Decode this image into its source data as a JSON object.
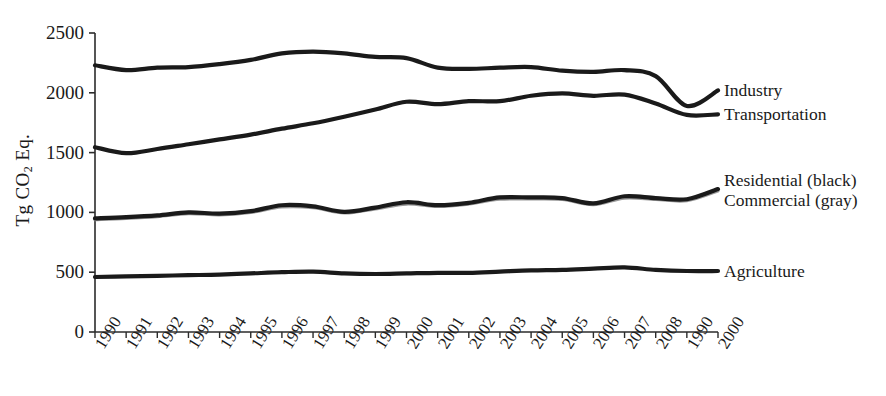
{
  "chart_data": {
    "type": "line",
    "title": "",
    "subtitle": "",
    "xlabel": "",
    "ylabel": "Tg CO2 Eq.",
    "ylabel_parts": {
      "prefix": "Tg CO",
      "sub": "2",
      "suffix": " Eq."
    },
    "grid": false,
    "legend_position": "inline-right",
    "ylim": [
      0,
      2500
    ],
    "yticks": [
      0,
      500,
      1000,
      1500,
      2000,
      2500
    ],
    "ytick_labels": [
      "0",
      "500",
      "1000",
      "1500",
      "2000",
      "2500"
    ],
    "categories": [
      "1990",
      "1991",
      "1992",
      "1993",
      "1994",
      "1995",
      "1996",
      "1997",
      "1998",
      "1999",
      "2000",
      "2001",
      "2002",
      "2003",
      "2004",
      "2005",
      "2006",
      "2007",
      "2008",
      "1990",
      "2000"
    ],
    "series": [
      {
        "name": "Industry",
        "color": "#1a1a1a",
        "label": "Industry",
        "values": [
          2230,
          2190,
          2210,
          2215,
          2240,
          2275,
          2330,
          2345,
          2330,
          2300,
          2290,
          2210,
          2200,
          2210,
          2215,
          2185,
          2175,
          2190,
          2140,
          1890,
          2020
        ]
      },
      {
        "name": "Transportation",
        "color": "#1a1a1a",
        "label": "Transportation",
        "values": [
          1545,
          1495,
          1530,
          1570,
          1610,
          1650,
          1700,
          1745,
          1800,
          1860,
          1925,
          1905,
          1930,
          1930,
          1975,
          1995,
          1975,
          1985,
          1910,
          1815,
          1820
        ]
      },
      {
        "name": "Residential (black)",
        "color": "#1a1a1a",
        "label": "Residential (black)",
        "values": [
          950,
          960,
          975,
          1000,
          990,
          1010,
          1060,
          1050,
          1005,
          1040,
          1085,
          1060,
          1080,
          1125,
          1125,
          1120,
          1075,
          1135,
          1120,
          1110,
          1195
        ]
      },
      {
        "name": "Commercial (gray)",
        "color": "#9a9a9a",
        "label": "Commercial (gray)",
        "values": [
          940,
          950,
          965,
          990,
          980,
          1000,
          1045,
          1040,
          995,
          1030,
          1070,
          1050,
          1070,
          1110,
          1112,
          1108,
          1065,
          1120,
          1108,
          1098,
          1180
        ]
      },
      {
        "name": "Agriculture",
        "color": "#1a1a1a",
        "label": "Agriculture",
        "values": [
          460,
          465,
          470,
          475,
          480,
          490,
          500,
          505,
          490,
          485,
          490,
          495,
          495,
          505,
          515,
          520,
          530,
          540,
          520,
          510,
          510
        ]
      }
    ],
    "series_labels": [
      {
        "text": "Industry",
        "ref": "Industry"
      },
      {
        "text": "Transportation",
        "ref": "Transportation"
      },
      {
        "text": "Residential (black)",
        "ref": "Residential (black)"
      },
      {
        "text": "Commercial (gray)",
        "ref": "Commercial (gray)"
      },
      {
        "text": "Agriculture",
        "ref": "Agriculture"
      }
    ]
  }
}
